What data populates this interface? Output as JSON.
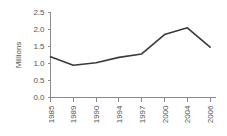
{
  "chart_data": {
    "type": "line",
    "title": "",
    "subtitle": "",
    "xlabel": "",
    "ylabel": "Millions",
    "categories": [
      "1985",
      "1989",
      "1990",
      "1994",
      "1997",
      "2000",
      "2004",
      "2006"
    ],
    "values": [
      1.2,
      0.95,
      1.02,
      1.18,
      1.28,
      1.85,
      2.05,
      1.48
    ],
    "series": [
      {
        "name": "Millions",
        "values": [
          1.2,
          0.95,
          1.02,
          1.18,
          1.28,
          1.85,
          2.05,
          1.48
        ]
      }
    ],
    "ylim": [
      0.0,
      2.5
    ],
    "ytick_labels": [
      "0.0",
      "0.5",
      "1.0",
      "1.5",
      "2.0",
      "2.5"
    ],
    "ytick_values": [
      0.0,
      0.5,
      1.0,
      1.5,
      2.0,
      2.5
    ],
    "xtick_labels": [
      "1985",
      "1989",
      "1990",
      "1994",
      "1997",
      "2000",
      "2004",
      "2006"
    ],
    "grid": false,
    "legend": false,
    "legend_position": "none",
    "xtick_label_rotation": "90",
    "line_color": "#3a3a3a",
    "axis_color": "#8a8a8a",
    "background_color": "#ffffff",
    "annotations": []
  }
}
